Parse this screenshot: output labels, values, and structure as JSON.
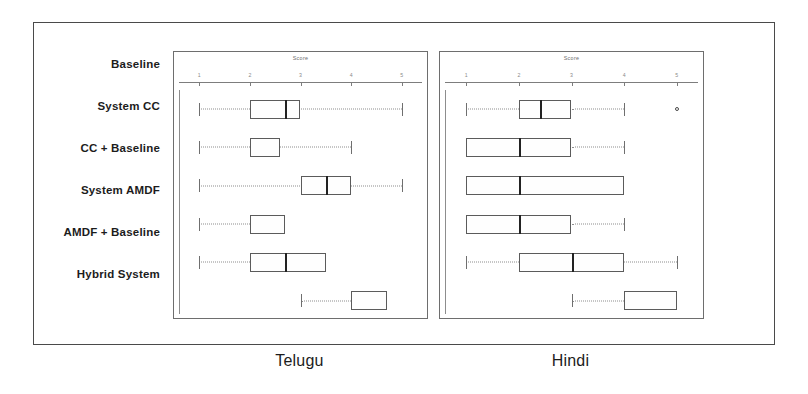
{
  "figure": {
    "axis_title": "Score",
    "axis_ticks": [
      1,
      2,
      3,
      4,
      5
    ],
    "axis_min": 0.6,
    "axis_max": 5.4,
    "systems": [
      "Baseline",
      "System CC",
      "CC + Baseline",
      "System AMDF",
      "AMDF + Baseline",
      "Hybrid System"
    ],
    "captions": {
      "telugu": "Telugu",
      "hindi": "Hindi"
    }
  },
  "chart_data": [
    {
      "type": "boxplot",
      "title": "Telugu",
      "xlabel": "Score",
      "ylabel": "",
      "xlim": [
        0.6,
        5.4
      ],
      "grid": false,
      "legend": "none",
      "categories": [
        "Baseline",
        "System CC",
        "CC + Baseline",
        "System AMDF",
        "AMDF + Baseline",
        "Hybrid System"
      ],
      "boxes": [
        {
          "name": "Baseline",
          "min": 1.0,
          "q1": 2.0,
          "median": 2.7,
          "q3": 3.0,
          "max": 5.0,
          "outliers": []
        },
        {
          "name": "System CC",
          "min": 1.0,
          "q1": 2.0,
          "median": 2.0,
          "q3": 2.6,
          "max": 4.0,
          "outliers": []
        },
        {
          "name": "CC + Baseline",
          "min": 1.0,
          "q1": 3.0,
          "median": 3.5,
          "q3": 4.0,
          "max": 5.0,
          "outliers": []
        },
        {
          "name": "System AMDF",
          "min": 1.0,
          "q1": 2.0,
          "median": 2.0,
          "q3": 2.7,
          "max": 2.7,
          "outliers": []
        },
        {
          "name": "AMDF + Baseline",
          "min": 1.0,
          "q1": 2.0,
          "median": 2.7,
          "q3": 3.5,
          "max": 3.5,
          "outliers": []
        },
        {
          "name": "Hybrid System",
          "min": 3.0,
          "q1": 4.0,
          "median": 4.0,
          "q3": 4.7,
          "max": 4.7,
          "outliers": []
        }
      ]
    },
    {
      "type": "boxplot",
      "title": "Hindi",
      "xlabel": "Score",
      "ylabel": "",
      "xlim": [
        0.6,
        5.4
      ],
      "grid": false,
      "legend": "none",
      "categories": [
        "Baseline",
        "System CC",
        "CC + Baseline",
        "System AMDF",
        "AMDF + Baseline",
        "Hybrid System"
      ],
      "boxes": [
        {
          "name": "Baseline",
          "min": 1.0,
          "q1": 2.0,
          "median": 2.4,
          "q3": 3.0,
          "max": 4.0,
          "outliers": [
            5.0
          ]
        },
        {
          "name": "System CC",
          "min": 1.0,
          "q1": 1.0,
          "median": 2.0,
          "q3": 3.0,
          "max": 4.0,
          "outliers": []
        },
        {
          "name": "CC + Baseline",
          "min": 1.0,
          "q1": 1.0,
          "median": 2.0,
          "q3": 4.0,
          "max": 4.0,
          "outliers": []
        },
        {
          "name": "System AMDF",
          "min": 1.0,
          "q1": 1.0,
          "median": 2.0,
          "q3": 3.0,
          "max": 4.0,
          "outliers": []
        },
        {
          "name": "AMDF + Baseline",
          "min": 1.0,
          "q1": 2.0,
          "median": 3.0,
          "q3": 4.0,
          "max": 5.0,
          "outliers": []
        },
        {
          "name": "Hybrid System",
          "min": 3.0,
          "q1": 4.0,
          "median": 4.0,
          "q3": 5.0,
          "max": 5.0,
          "outliers": []
        }
      ]
    }
  ]
}
